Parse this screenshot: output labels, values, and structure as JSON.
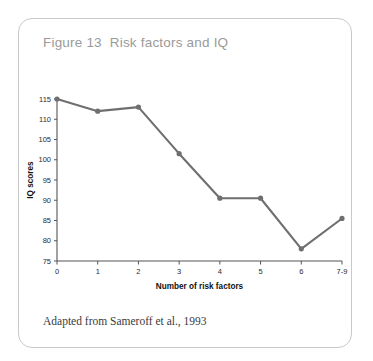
{
  "figure": {
    "title": "Figure 13  Risk factors and IQ",
    "source_caption": "Adapted from Sameroff et al., 1993"
  },
  "colors": {
    "line": "#6f6f6f",
    "marker": "#6f6f6f",
    "axis": "#555555",
    "title_text": "#9a9a9a",
    "card_border": "#c9c9c9",
    "background": "#ffffff"
  },
  "chart_data": {
    "type": "line",
    "title": "Figure 13  Risk factors and IQ",
    "xlabel": "Number of risk factors",
    "ylabel": "IQ scores",
    "categories": [
      "0",
      "1",
      "2",
      "3",
      "4",
      "5",
      "6",
      "7-9"
    ],
    "values": [
      115,
      112,
      113,
      101.5,
      90.5,
      90.5,
      78,
      85.5
    ],
    "ylim": [
      75,
      115
    ],
    "yticks": [
      75,
      80,
      85,
      90,
      95,
      100,
      105,
      110,
      115
    ],
    "ytick_labels": [
      "75",
      "80",
      "85",
      "90",
      "95",
      "100",
      "105",
      "110",
      "115"
    ],
    "xtick_labels": [
      "0",
      "1",
      "2",
      "3",
      "4",
      "5",
      "6",
      "7-9"
    ],
    "grid": false,
    "legend": false,
    "marker": "circle",
    "series": [
      {
        "name": "IQ scores",
        "values": [
          115,
          112,
          113,
          101.5,
          90.5,
          90.5,
          78,
          85.5
        ]
      }
    ]
  }
}
